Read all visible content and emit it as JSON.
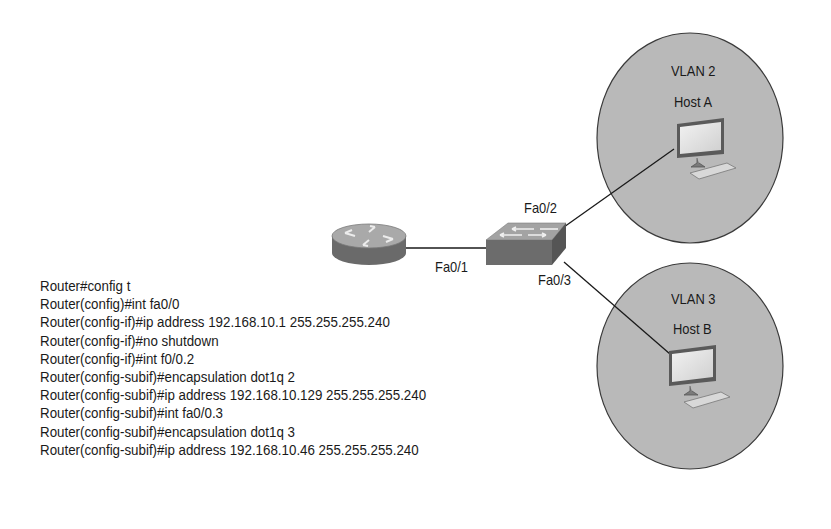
{
  "diagram": {
    "router": {
      "icon": "router-icon"
    },
    "switch": {
      "icon": "switch-icon"
    },
    "links": [
      {
        "from": "router",
        "to": "switch",
        "port_label": "Fa0/1"
      },
      {
        "from": "switch",
        "to": "host_a",
        "port_label": "Fa0/2"
      },
      {
        "from": "switch",
        "to": "host_b",
        "port_label": "Fa0/3"
      }
    ],
    "vlans": [
      {
        "name": "VLAN 2",
        "host": "Host A",
        "icon": "computer-icon"
      },
      {
        "name": "VLAN 3",
        "host": "Host B",
        "icon": "computer-icon"
      }
    ]
  },
  "config": {
    "lines": [
      "Router#config t",
      "Router(config)#int fa0/0",
      "Router(config-if)#ip address 192.168.10.1 255.255.255.240",
      "Router(config-if)#no shutdown",
      "Router(config-if)#int f0/0.2",
      "Router(config-subif)#encapsulation dot1q 2",
      "Router(config-subif)#ip address 192.168.10.129 255.255.255.240",
      "Router(config-subif)#int fa0/0.3",
      "Router(config-subif)#encapsulation dot1q 3",
      "Router(config-subif)#ip address 192.168.10.46 255.255.255.240"
    ]
  },
  "colors": {
    "vlan_fill": "#b9b9b9",
    "device_dark": "#6e6e6e",
    "device_light": "#a8a8a8",
    "line": "#1a1a1a"
  }
}
